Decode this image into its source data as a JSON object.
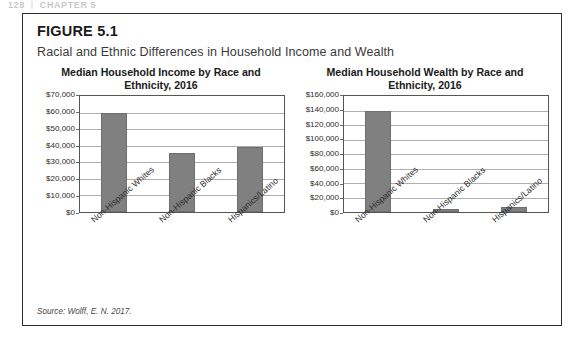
{
  "page_header": {
    "folio": "128",
    "separator": "|",
    "running_head": "CHAPTER 5"
  },
  "figure": {
    "label": "FIGURE 5.1",
    "caption": "Racial and Ethnic Differences in Household Income and Wealth",
    "source_note": "Source: Wolff, E. N. 2017."
  },
  "style": {
    "bar_color": "#808080",
    "bar_border_color": "#6f6f6f",
    "gridline_color": "#aeaeae",
    "box_border_color": "#2f2f2f"
  },
  "chart_data": [
    {
      "type": "bar",
      "title": "Median Household Income by Race and Ethnicity, 2016",
      "xlabel": "",
      "ylabel": "",
      "categories": [
        "Non-Hispanic Whites",
        "Non-Hispanic Blacks",
        "Hispanics/Latino"
      ],
      "values": [
        60000,
        35500,
        39000
      ],
      "ylim": [
        0,
        70000
      ],
      "ytick_labels": [
        "$70,000",
        "$60,000",
        "$50,000",
        "$40,000",
        "$30,000",
        "$20,000",
        "$10,000",
        "$0"
      ],
      "ytick_values": [
        70000,
        60000,
        50000,
        40000,
        30000,
        20000,
        10000,
        0
      ],
      "grid": true,
      "legend": "none"
    },
    {
      "type": "bar",
      "title": "Median Household Wealth by Race and Ethnicity, 2016",
      "xlabel": "",
      "ylabel": "",
      "categories": [
        "Non-Hispanic Whites",
        "Non-Hispanic Blacks",
        "Hispanics/Latino"
      ],
      "values": [
        140000,
        3500,
        7000
      ],
      "ylim": [
        0,
        160000
      ],
      "ytick_labels": [
        "$160,000",
        "$140,000",
        "$120,000",
        "$100,000",
        "$80,000",
        "$60,000",
        "$40,000",
        "$20,000",
        "$0"
      ],
      "ytick_values": [
        160000,
        140000,
        120000,
        100000,
        80000,
        60000,
        40000,
        20000,
        0
      ],
      "grid": true,
      "legend": "none"
    }
  ]
}
